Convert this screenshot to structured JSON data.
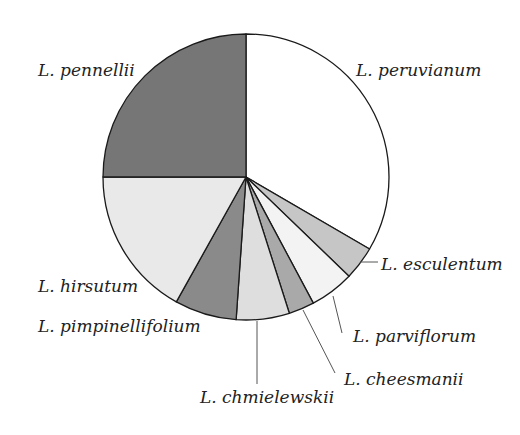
{
  "chart_data": {
    "type": "pie",
    "title": "",
    "start_angle_deg": 0,
    "direction": "clockwise",
    "categories": [
      "L. peruvianum",
      "L. esculentum",
      "L. parviflorum",
      "L. cheesmanii",
      "L. chmielewskii",
      "L. pimpinellifolium",
      "L. hirsutum",
      "L. pennellii"
    ],
    "values": [
      33.4,
      3.8,
      5.0,
      2.9,
      6.0,
      7.0,
      16.9,
      25.0
    ],
    "colors": [
      "#ffffff",
      "#c6c6c6",
      "#f3f3f3",
      "#a9a9a9",
      "#dedede",
      "#8a8a8a",
      "#e9e9e9",
      "#767676"
    ],
    "legend": "none (direct labels)",
    "units": "percent (estimated from angles)"
  },
  "labels": {
    "peruvianum": "L. peruvianum",
    "esculentum": "L. esculentum",
    "parviflorum": "L. parviflorum",
    "cheesmanii": "L. cheesmanii",
    "chmielewskii": "L. chmielewskii",
    "pimpinellifolium": "L. pimpinellifolium",
    "hirsutum": "L. hirsutum",
    "pennellii": "L. pennellii"
  },
  "style": {
    "outline_color": "#1a1a1a",
    "leader_color": "#555555"
  }
}
